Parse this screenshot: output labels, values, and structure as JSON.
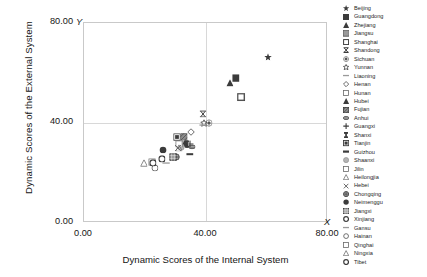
{
  "chart_data": {
    "type": "scatter",
    "title": "",
    "xlabel": "Dynamic Scores of the Internal System",
    "ylabel": "Dynamic Scores of the External System",
    "x_axis_letter": "X",
    "y_axis_letter": "Y",
    "xlim": [
      0,
      80
    ],
    "ylim": [
      0,
      80
    ],
    "xticks": [
      "0.00",
      "40.00",
      "80.00"
    ],
    "yticks": [
      "0.00",
      "40.00",
      "80.00"
    ],
    "xtick_values": [
      0,
      40,
      80
    ],
    "ytick_values": [
      0,
      40,
      80
    ],
    "grid": "major gridlines at 40.00 on both axes",
    "legend_position": "right",
    "points": [
      {
        "name": "Beijing",
        "marker": "star-filled",
        "x": 60.4,
        "y": 66.6
      },
      {
        "name": "Guangdong",
        "marker": "square-filled",
        "x": 49.8,
        "y": 58.0
      },
      {
        "name": "Zhejiang",
        "marker": "triangle-filled",
        "x": 47.8,
        "y": 56.1
      },
      {
        "name": "Jiangsu",
        "marker": "square-shaded",
        "x": 51.6,
        "y": 50.3
      },
      {
        "name": "Shanghai",
        "marker": "square-open",
        "x": 51.6,
        "y": 50.3
      },
      {
        "name": "Shandong",
        "marker": "bowtie",
        "x": 38.9,
        "y": 43.8
      },
      {
        "name": "Sichuan",
        "marker": "circle-dot",
        "x": 40.9,
        "y": 39.9
      },
      {
        "name": "Yunnan",
        "marker": "star-open",
        "x": 39.2,
        "y": 39.9
      },
      {
        "name": "Liaoning",
        "marker": "dash",
        "x": 38.9,
        "y": 39.6
      },
      {
        "name": "Henan",
        "marker": "diamond-open",
        "x": 35.2,
        "y": 36.4
      },
      {
        "name": "Hunan",
        "marker": "square-open-sm",
        "x": 31.6,
        "y": 31.6
      },
      {
        "name": "Hubei",
        "marker": "triangle-filled",
        "x": 33.2,
        "y": 31.9
      },
      {
        "name": "Fujian",
        "marker": "square-hatch",
        "x": 32.7,
        "y": 34.5
      },
      {
        "name": "Anhui",
        "marker": "ellipse-filled",
        "x": 35.4,
        "y": 30.5
      },
      {
        "name": "Guangxi",
        "marker": "plus",
        "x": 34.8,
        "y": 31.8
      },
      {
        "name": "Shanxi",
        "marker": "barbell",
        "x": 33.8,
        "y": 31.6
      },
      {
        "name": "Tianjin",
        "marker": "square-box",
        "x": 30.4,
        "y": 34.4
      },
      {
        "name": "Guizhou",
        "marker": "heavy-dash",
        "x": 34.6,
        "y": 28.0
      },
      {
        "name": "Shaanxi",
        "marker": "circle-grey",
        "x": 31.9,
        "y": 30.4
      },
      {
        "name": "Jilin",
        "marker": "square-open-sm",
        "x": 31.3,
        "y": 31.8
      },
      {
        "name": "Heilongjia",
        "marker": "triangle-open",
        "x": 31.0,
        "y": 30.2
      },
      {
        "name": "Hebei",
        "marker": "cross-x",
        "x": 30.8,
        "y": 30.0
      },
      {
        "name": "Chongqing",
        "marker": "circle-hatch",
        "x": 30.2,
        "y": 26.5
      },
      {
        "name": "Neimenggu",
        "marker": "circle-filled",
        "x": 26.0,
        "y": 29.4
      },
      {
        "name": "Jiangxi",
        "marker": "square-grid",
        "x": 29.2,
        "y": 26.4
      },
      {
        "name": "Xinjiang",
        "marker": "circle-open-lg",
        "x": 25.5,
        "y": 25.7
      },
      {
        "name": "Gansu",
        "marker": "dash",
        "x": 27.0,
        "y": 24.3
      },
      {
        "name": "Hainan",
        "marker": "circle-open",
        "x": 23.2,
        "y": 22.1
      },
      {
        "name": "Qinghai",
        "marker": "square-open-sm",
        "x": 22.4,
        "y": 24.4
      },
      {
        "name": "Ningxia",
        "marker": "triangle-open",
        "x": 19.6,
        "y": 23.9
      },
      {
        "name": "Tibet",
        "marker": "circle-open-lg",
        "x": 22.6,
        "y": 24.2
      }
    ],
    "legend_entries": [
      {
        "label": "Beijing",
        "marker": "star-filled"
      },
      {
        "label": "Guangdong",
        "marker": "square-filled"
      },
      {
        "label": "Zhejiang",
        "marker": "triangle-filled"
      },
      {
        "label": "Jiangsu",
        "marker": "square-shaded"
      },
      {
        "label": "Shanghai",
        "marker": "square-open"
      },
      {
        "label": "Shandong",
        "marker": "bowtie"
      },
      {
        "label": "Sichuan",
        "marker": "circle-dot"
      },
      {
        "label": "Yunnan",
        "marker": "star-open"
      },
      {
        "label": "Liaoning",
        "marker": "dash"
      },
      {
        "label": "Henan",
        "marker": "diamond-open"
      },
      {
        "label": "Hunan",
        "marker": "square-open-sm"
      },
      {
        "label": "Hubei",
        "marker": "triangle-filled"
      },
      {
        "label": "Fujian",
        "marker": "square-hatch"
      },
      {
        "label": "Anhui",
        "marker": "ellipse-filled"
      },
      {
        "label": "Guangxi",
        "marker": "plus"
      },
      {
        "label": "Shanxi",
        "marker": "barbell"
      },
      {
        "label": "Tianjin",
        "marker": "square-box"
      },
      {
        "label": "Guizhou",
        "marker": "heavy-dash"
      },
      {
        "label": "Shaanxi",
        "marker": "circle-grey"
      },
      {
        "label": "Jilin",
        "marker": "square-open-sm"
      },
      {
        "label": "Heilongjia",
        "marker": "triangle-open"
      },
      {
        "label": "Hebei",
        "marker": "cross-x"
      },
      {
        "label": "Chongqing",
        "marker": "circle-hatch"
      },
      {
        "label": "Neimenggu",
        "marker": "circle-filled"
      },
      {
        "label": "Jiangxi",
        "marker": "square-grid"
      },
      {
        "label": "Xinjiang",
        "marker": "circle-open-lg"
      },
      {
        "label": "Gansu",
        "marker": "dash"
      },
      {
        "label": "Hainan",
        "marker": "circle-open"
      },
      {
        "label": "Qinghai",
        "marker": "square-open-sm"
      },
      {
        "label": "Ningxia",
        "marker": "triangle-open"
      },
      {
        "label": "Tibet",
        "marker": "circle-open-lg"
      }
    ]
  }
}
